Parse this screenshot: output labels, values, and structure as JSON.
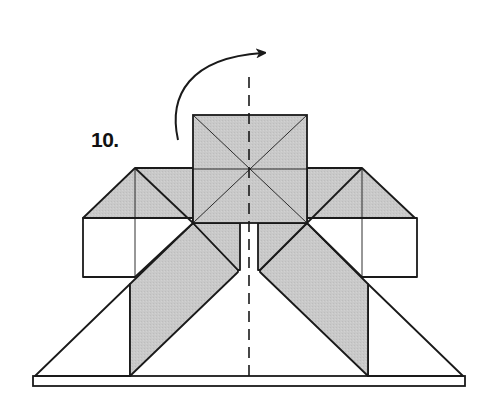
{
  "diagram": {
    "type": "origami-instruction",
    "step": {
      "number": "10."
    },
    "fold": {
      "action": "turn-over",
      "arrow": "curved-arrow-right",
      "axis": "vertical-dashed-center-line"
    },
    "colors": {
      "paper_colored": "#c8c8c8",
      "paper_white": "#ffffff",
      "line": "#1a1a1a",
      "background": "#ffffff"
    }
  }
}
